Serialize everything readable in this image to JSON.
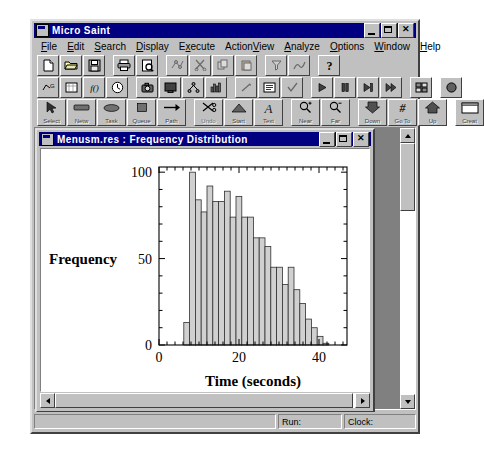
{
  "app": {
    "title": "Micro Saint",
    "icon": "application-icon",
    "window_buttons": [
      {
        "name": "minimize",
        "glyph": "_"
      },
      {
        "name": "maximize",
        "glyph": "□"
      },
      {
        "name": "close",
        "glyph": "✕"
      }
    ]
  },
  "menubar": {
    "items": [
      {
        "label": "File",
        "mnemonic": "F"
      },
      {
        "label": "Edit",
        "mnemonic": "E"
      },
      {
        "label": "Search",
        "mnemonic": "S"
      },
      {
        "label": "Display",
        "mnemonic": "D"
      },
      {
        "label": "Execute",
        "mnemonic": "x"
      },
      {
        "label": "ActionView",
        "mnemonic": "V"
      },
      {
        "label": "Analyze",
        "mnemonic": "A"
      },
      {
        "label": "Options",
        "mnemonic": "O"
      },
      {
        "label": "Window",
        "mnemonic": "W"
      },
      {
        "label": "Help",
        "mnemonic": "H"
      }
    ]
  },
  "toolbar_row1": {
    "buttons": [
      {
        "name": "new-file-icon",
        "enabled": true
      },
      {
        "name": "open-folder-icon",
        "enabled": true
      },
      {
        "name": "save-disk-icon",
        "enabled": true
      },
      {
        "name": "print-icon",
        "enabled": true
      },
      {
        "name": "print-preview-icon",
        "enabled": true
      },
      {
        "name": "cut-network-icon",
        "enabled": false
      },
      {
        "name": "scissors-cut-icon",
        "enabled": false
      },
      {
        "name": "copy-icon",
        "enabled": false
      },
      {
        "name": "paste-icon",
        "enabled": false
      },
      {
        "name": "filter-icon",
        "enabled": false
      },
      {
        "name": "chart-icon",
        "enabled": false
      },
      {
        "name": "help-question-icon",
        "enabled": true
      }
    ]
  },
  "toolbar_row2": {
    "buttons": [
      {
        "name": "scenario-icon",
        "enabled": true
      },
      {
        "name": "variables-icon",
        "enabled": true
      },
      {
        "name": "function-icon",
        "enabled": true
      },
      {
        "name": "clock-icon",
        "enabled": true
      },
      {
        "name": "snapshot-icon",
        "enabled": true
      },
      {
        "name": "monitor-icon",
        "enabled": true
      },
      {
        "name": "hierarchy-icon",
        "enabled": true
      },
      {
        "name": "histogram-icon",
        "enabled": true
      },
      {
        "name": "pointer-line-icon",
        "enabled": false
      },
      {
        "name": "list-icon",
        "enabled": true
      },
      {
        "name": "checkmark-icon",
        "enabled": false
      },
      {
        "name": "run-play-icon",
        "enabled": true
      },
      {
        "name": "pause-icon",
        "enabled": true
      },
      {
        "name": "step-icon",
        "enabled": true
      },
      {
        "name": "fast-forward-icon",
        "enabled": true
      },
      {
        "name": "batch-icon",
        "enabled": true
      },
      {
        "name": "record-icon",
        "enabled": true
      }
    ]
  },
  "toolbar_row3": {
    "buttons": [
      {
        "label": "Select",
        "name": "select-tool",
        "icon": "arrow-cursor-icon",
        "active": true
      },
      {
        "label": "Netw",
        "name": "network-tool",
        "icon": "rectangle-icon",
        "active": true
      },
      {
        "label": "Task",
        "name": "task-tool",
        "icon": "ellipse-icon",
        "active": true
      },
      {
        "label": "Queue",
        "name": "queue-tool",
        "icon": "square-icon",
        "active": true
      },
      {
        "label": "Path",
        "name": "path-tool",
        "icon": "arrow-right-icon",
        "active": true
      },
      {
        "label": "Undo",
        "name": "undo-tool",
        "icon": "scissors-icon",
        "active": false
      },
      {
        "label": "Start",
        "name": "start-tool",
        "icon": "triangle-icon",
        "active": true
      },
      {
        "label": "Text",
        "name": "text-tool",
        "icon": "letter-a-icon",
        "active": true
      },
      {
        "label": "Near",
        "name": "zoom-in-tool",
        "icon": "magnifier-plus-icon",
        "active": true
      },
      {
        "label": "Far",
        "name": "zoom-out-tool",
        "icon": "magnifier-minus-icon",
        "active": true
      },
      {
        "label": "Down",
        "name": "go-down-tool",
        "icon": "arrow-down-solid-icon",
        "active": true
      },
      {
        "label": "Go To",
        "name": "goto-tool",
        "icon": "hash-icon",
        "active": true
      },
      {
        "label": "Up",
        "name": "go-up-tool",
        "icon": "arrow-up-solid-icon",
        "active": true
      },
      {
        "label": "Creat",
        "name": "create-window-tool",
        "icon": "window-icon",
        "active": true
      }
    ]
  },
  "child_window": {
    "title": "Menusm.res : Frequency Distribution",
    "icon": "document-icon",
    "window_buttons": [
      {
        "name": "minimize",
        "glyph": "_"
      },
      {
        "name": "maximize",
        "glyph": "□"
      },
      {
        "name": "close",
        "glyph": "✕"
      }
    ]
  },
  "statusbar": {
    "message": "",
    "run_label": "Run:",
    "clock_label": "Clock:"
  },
  "chart_data": {
    "type": "bar",
    "title": "",
    "xlabel": "Time (seconds)",
    "ylabel": "Frequency",
    "xlim": [
      0,
      47
    ],
    "ylim": [
      0,
      103
    ],
    "xticks": [
      0,
      20,
      40
    ],
    "xtick_labels": [
      "0",
      "20",
      "40"
    ],
    "yticks": [
      0,
      50,
      100
    ],
    "ytick_labels": [
      "0",
      "50",
      "100"
    ],
    "x_minor_tick_step": 2,
    "y_minor_tick_step": 10,
    "grid": false,
    "legend": false,
    "bar_fill": "#d0d0d0",
    "bar_edge": "#303030",
    "bin_width": 1.45,
    "bin_starts": [
      6.2,
      7.65,
      9.1,
      10.55,
      12.0,
      13.45,
      14.9,
      16.35,
      17.8,
      19.25,
      20.7,
      22.15,
      23.6,
      25.05,
      26.5,
      27.95,
      29.4,
      30.85,
      32.3,
      33.75,
      35.2,
      36.65,
      38.1,
      39.55,
      41.0
    ],
    "values": [
      13,
      100,
      84,
      77,
      92,
      83,
      83,
      89,
      74,
      86,
      74,
      74,
      62,
      62,
      57,
      45,
      45,
      35,
      45,
      32,
      24,
      15,
      10,
      5,
      1
    ]
  }
}
